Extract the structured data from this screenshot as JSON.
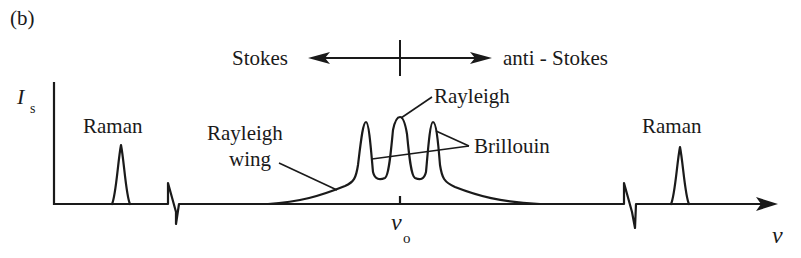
{
  "figure": {
    "panel_label": "(b)",
    "direction": {
      "left_label": "Stokes",
      "right_label": "anti - Stokes"
    },
    "axes": {
      "y_label_main": "I",
      "y_label_sub": "s",
      "x_label": "ν",
      "center_label_main": "ν",
      "center_label_sub": "o"
    },
    "peaks": {
      "raman_left": "Raman",
      "raman_right": "Raman",
      "rayleigh": "Rayleigh",
      "brillouin": "Brillouin",
      "rayleigh_wing_line1": "Rayleigh",
      "rayleigh_wing_line2": "wing"
    },
    "colors": {
      "ink": "#1a1a1a",
      "background": "#ffffff"
    }
  }
}
